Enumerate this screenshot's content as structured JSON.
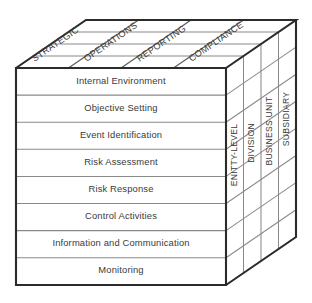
{
  "diagram": {
    "name": "coso-erm-cube",
    "type": "3d-cube-matrix",
    "colors": {
      "background": "#ffffff",
      "outer_edge": "#2b2b2b",
      "inner_grid": "#8a8a8a",
      "text": "#3a3a3a",
      "face": "#ffffff"
    }
  },
  "front_face": {
    "name": "components",
    "rows": [
      {
        "label": "Internal Environment"
      },
      {
        "label": "Objective Setting"
      },
      {
        "label": "Event Identification"
      },
      {
        "label": "Risk Assessment"
      },
      {
        "label": "Risk Response"
      },
      {
        "label": "Control Activities"
      },
      {
        "label": "Information and Communication"
      },
      {
        "label": "Monitoring"
      }
    ]
  },
  "top_face": {
    "name": "objectives",
    "columns": [
      {
        "label": "STRATEGIC"
      },
      {
        "label": "OPERATIONS"
      },
      {
        "label": "REPORTING"
      },
      {
        "label": "COMPLIANCE"
      }
    ]
  },
  "right_face": {
    "name": "organizational-levels",
    "columns": [
      {
        "label": "ENITTY-LEVEL"
      },
      {
        "label": "DIVISION"
      },
      {
        "label": "BUSINESS UNIT"
      },
      {
        "label": "SUBSIDIARY"
      }
    ]
  }
}
